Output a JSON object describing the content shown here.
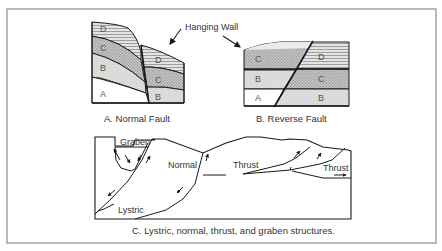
{
  "figure": {
    "frame_color": "#8a8a8a",
    "line_color": "#1a1a1a",
    "panels": [
      {
        "id": "A",
        "caption": "A.  Normal Fault",
        "layers_left": [
          "D",
          "C",
          "B",
          "A"
        ],
        "layers_right": [
          "D",
          "C",
          "B"
        ]
      },
      {
        "id": "B",
        "caption": "B.  Reverse Fault",
        "layers_left": [
          "C",
          "B",
          "A"
        ],
        "layers_right": [
          "D",
          "C",
          "B"
        ]
      },
      {
        "id": "C",
        "caption": "C. Lystric, normal, thrust, and graben structures.",
        "labels": {
          "graben": "Graben",
          "normal": "Normal",
          "lystric": "Lystric",
          "thrust_1": "Thrust",
          "thrust_2": "Thrust"
        }
      }
    ],
    "annotation": {
      "hanging_wall": "Hanging Wall"
    },
    "patterns": {
      "D": "horizontal-lines",
      "C": "dotted-crosshatch",
      "B": "light-stipple",
      "A": "blank"
    },
    "pattern_colors": {
      "D": "#d8d8d8",
      "C": "#bdbdbd",
      "B": "#d6d6d6",
      "A": "#ffffff"
    }
  }
}
